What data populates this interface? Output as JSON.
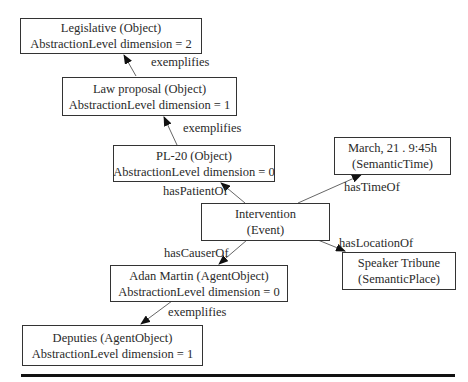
{
  "nodes": {
    "legislative": {
      "line1": "Legislative (Object)",
      "line2": "AbstractionLevel dimension = 2"
    },
    "law_proposal": {
      "line1": "Law proposal (Object)",
      "line2": "AbstractionLevel dimension = 1"
    },
    "pl20": {
      "line1": "PL-20 (Object)",
      "line2": "AbstractionLevel dimension = 0"
    },
    "intervention": {
      "line1": "Intervention",
      "line2": "(Event)"
    },
    "time": {
      "line1": "March, 21 . 9:45h",
      "line2": "(SemanticTime)"
    },
    "place": {
      "line1": "Speaker Tribune",
      "line2": "(SemanticPlace)"
    },
    "adan": {
      "line1": "Adan Martin (AgentObject)",
      "line2": "AbstractionLevel dimension = 0"
    },
    "deputies": {
      "line1": "Deputies (AgentObject)",
      "line2": "AbstractionLevel dimension = 1"
    }
  },
  "edges": {
    "law_to_legislative": "exemplifies",
    "pl20_to_law": "exemplifies",
    "intervention_to_pl20": "hasPatientOf",
    "intervention_to_time": "hasTimeOf",
    "intervention_to_place": "hasLocationOf",
    "intervention_to_adan": "hasCauserOf",
    "adan_to_deputies": "exemplifies"
  },
  "colors": {
    "line": "#555555",
    "border": "#333333",
    "rule": "#111111"
  }
}
